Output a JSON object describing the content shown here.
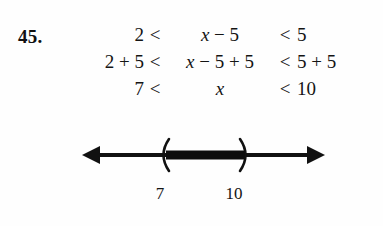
{
  "problem": {
    "number": "45."
  },
  "derivation": {
    "rows": [
      {
        "left": "2",
        "relation_left": "<",
        "middle_prefix": "x",
        "middle_suffix": " − 5",
        "relation_right": "<",
        "right": "5"
      },
      {
        "left": "2 + 5",
        "relation_left": "<",
        "middle_prefix": "x",
        "middle_suffix": " − 5 + 5",
        "relation_right": "<",
        "right": "5 + 5"
      },
      {
        "left": "7",
        "relation_left": "<",
        "middle_prefix": "x",
        "middle_suffix": "",
        "relation_right": "<",
        "right": "10"
      }
    ]
  },
  "numberline": {
    "lower_label": "7",
    "upper_label": "10",
    "lower_bracket": "(",
    "upper_bracket": ")",
    "line_color": "#111111",
    "interval_color": "#0d0d0d",
    "interval_type": "open",
    "left_arrow": "left-arrow-icon",
    "right_arrow": "right-arrow-icon"
  }
}
